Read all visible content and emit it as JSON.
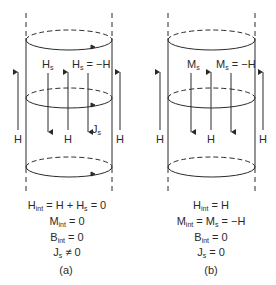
{
  "panel_a": {
    "label_Hs": "H",
    "label_Hs_sub": "s",
    "label_Hs_eq": "H",
    "label_Hs_eq_sub": "s",
    "label_Hs_eq_rhs": " = −H",
    "label_H": "H",
    "label_Js": "J",
    "label_Js_sub": "s",
    "equations": [
      {
        "lhs": "H",
        "sub": "int",
        "rhs": " = H + H",
        "rhs_sub": "s",
        "tail": " = 0"
      },
      {
        "lhs": "M",
        "sub": "int",
        "rhs": " = 0"
      },
      {
        "lhs": "B",
        "sub": "int",
        "rhs": " = 0"
      },
      {
        "lhs": "J",
        "sub": "s",
        "rhs": " ≠ 0"
      }
    ],
    "caption": "(a)"
  },
  "panel_b": {
    "label_Ms": "M",
    "label_Ms_sub": "s",
    "label_Ms_eq": "M",
    "label_Ms_eq_sub": "s",
    "label_Ms_eq_rhs": " = −H",
    "label_H": "H",
    "equations": [
      {
        "lhs": "H",
        "sub": "int",
        "rhs": " = H"
      },
      {
        "lhs": "M",
        "sub": "int",
        "rhs": " = M",
        "rhs_sub": "s",
        "tail": " = −H"
      },
      {
        "lhs": "B",
        "sub": "int",
        "rhs": " = 0"
      },
      {
        "lhs": "J",
        "sub": "s",
        "rhs": " = 0"
      }
    ],
    "caption": "(b)"
  },
  "colors": {
    "stroke": "#2a2a2a",
    "background": "#ffffff"
  }
}
